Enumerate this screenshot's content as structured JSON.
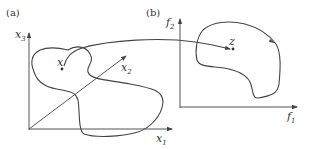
{
  "figure": {
    "panel_a": {
      "label": "(a)",
      "axes": {
        "vertical": {
          "name": "x",
          "sub": "3"
        },
        "horizontal": {
          "name": "x",
          "sub": "1"
        },
        "diagonal": {
          "name": "x",
          "sub": "2"
        }
      },
      "point_label": "x",
      "description": "Decision space with feasible region"
    },
    "panel_b": {
      "label": "(b)",
      "axes": {
        "vertical": {
          "name": "f",
          "sub": "2"
        },
        "horizontal": {
          "name": "f",
          "sub": "1"
        }
      },
      "point_label": "z",
      "description": "Objective space with mapped region"
    },
    "mapping": "Arrow maps point x in decision space to point z in objective space",
    "colors": {
      "ink": "#444444",
      "background": "#ffffff"
    }
  }
}
